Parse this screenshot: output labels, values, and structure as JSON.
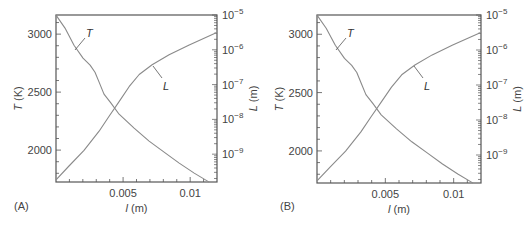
{
  "chart_data": [
    {
      "panel": "(A)",
      "type": "line",
      "xlabel_var": "l",
      "xlabel_unit": " (m)",
      "ylabel_left_var": "T",
      "ylabel_left_unit": " (K)",
      "ylabel_right_var": "L",
      "ylabel_right_unit": " (m)",
      "xlim": [
        0,
        0.012
      ],
      "ylim_left": [
        1725,
        3165
      ],
      "ylim_right_log10": [
        -9.8,
        -5
      ],
      "x_ticks": [
        0.005,
        0.01
      ],
      "x_tick_labels": [
        "0.005",
        "0.01"
      ],
      "y_left_ticks": [
        2000,
        2500,
        3000
      ],
      "y_left_tick_labels": [
        "2000",
        "2500",
        "3000"
      ],
      "y_right_ticks_log10": [
        -5,
        -6,
        -7,
        -8,
        -9
      ],
      "y_right_tick_labels": [
        "10",
        "10",
        "10",
        "10",
        "10"
      ],
      "y_right_tick_exponents": [
        "−5",
        "−6",
        "−7",
        "−8",
        "−9"
      ],
      "series": [
        {
          "name": "T",
          "axis": "left",
          "x": [
            0,
            0.00067,
            0.00134,
            0.00201,
            0.00254,
            0.00291,
            0.00321,
            0.00358,
            0.0041,
            0.0047,
            0.00582,
            0.00694,
            0.00806,
            0.00918,
            0.0103,
            0.01142
          ],
          "y": [
            3164,
            3052,
            2905,
            2793,
            2733,
            2672,
            2586,
            2483,
            2405,
            2310,
            2190,
            2078,
            1983,
            1888,
            1802,
            1724
          ]
        },
        {
          "name": "L",
          "axis": "right",
          "x": [
            0,
            0.00097,
            0.00209,
            0.00321,
            0.00396,
            0.0047,
            0.00545,
            0.0062,
            0.00716,
            0.00843,
            0.00993,
            0.01194
          ],
          "y_log10": [
            -9.74,
            -9.34,
            -8.89,
            -8.34,
            -7.91,
            -7.49,
            -7.06,
            -6.71,
            -6.43,
            -6.14,
            -5.86,
            -5.51
          ]
        }
      ],
      "annotations": [
        {
          "text": "T",
          "series": "T"
        },
        {
          "text": "L",
          "series": "L"
        }
      ]
    },
    {
      "panel": "(B)",
      "type": "line",
      "xlabel_var": "l",
      "xlabel_unit": " (m)",
      "ylabel_left_var": "T",
      "ylabel_left_unit": " (K)",
      "ylabel_right_var": "L",
      "ylabel_right_unit": " (m)",
      "xlim": [
        0,
        0.012
      ],
      "ylim_left": [
        1725,
        3165
      ],
      "ylim_right_log10": [
        -9.8,
        -5
      ],
      "x_ticks": [
        0.005,
        0.01
      ],
      "x_tick_labels": [
        "0.005",
        "0.01"
      ],
      "y_left_ticks": [
        2000,
        2500,
        3000
      ],
      "y_left_tick_labels": [
        "2000",
        "2500",
        "3000"
      ],
      "y_right_ticks_log10": [
        -5,
        -6,
        -7,
        -8,
        -9
      ],
      "y_right_tick_labels": [
        "10",
        "10",
        "10",
        "10",
        "10"
      ],
      "y_right_tick_exponents": [
        "−5",
        "−6",
        "−7",
        "−8",
        "−9"
      ],
      "series": [
        {
          "name": "T",
          "axis": "left",
          "x": [
            0,
            0.00067,
            0.00134,
            0.00201,
            0.00254,
            0.00291,
            0.00321,
            0.00358,
            0.0041,
            0.0047,
            0.00582,
            0.00694,
            0.00806,
            0.00918,
            0.0103,
            0.01142
          ],
          "y": [
            3164,
            3052,
            2905,
            2793,
            2733,
            2672,
            2586,
            2483,
            2405,
            2310,
            2190,
            2078,
            1983,
            1888,
            1802,
            1724
          ]
        },
        {
          "name": "L",
          "axis": "right",
          "x": [
            0,
            0.00097,
            0.00209,
            0.00321,
            0.00396,
            0.0047,
            0.00545,
            0.0062,
            0.00716,
            0.00843,
            0.00993,
            0.01194
          ],
          "y_log10": [
            -9.74,
            -9.34,
            -8.89,
            -8.34,
            -7.91,
            -7.49,
            -7.06,
            -6.71,
            -6.43,
            -6.14,
            -5.86,
            -5.51
          ]
        }
      ],
      "annotations": [
        {
          "text": "T",
          "series": "T"
        },
        {
          "text": "L",
          "series": "L"
        }
      ]
    }
  ],
  "style": {
    "curve_color": "#8a8a8a",
    "axis_color": "#555555",
    "text_color": "#444444"
  }
}
